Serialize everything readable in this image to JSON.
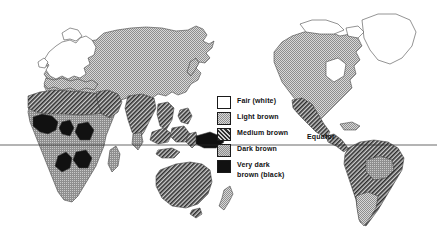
{
  "figure": {
    "kind": "thematic-world-map",
    "projection_note": "Pacific-centred split world map; Eurasia/Africa left, Americas right"
  },
  "equator": {
    "label": "Equator",
    "line_y_px": 145
  },
  "legend": {
    "title": "",
    "items": [
      {
        "key": "fair",
        "label": "Fair (white)",
        "fill": "#ffffff",
        "pattern": "none"
      },
      {
        "key": "light",
        "label": "Light brown",
        "fill": "#b9b9b9",
        "pattern": "fine-stipple"
      },
      {
        "key": "medium",
        "label": "Medium brown",
        "fill": "#8a8a8a",
        "pattern": "diagonal-hatch"
      },
      {
        "key": "dark",
        "label": "Dark brown",
        "fill": "#9c9c9c",
        "pattern": "coarse-stipple"
      },
      {
        "key": "verydark",
        "label": "Very dark\nbrown (black)",
        "fill": "#111111",
        "pattern": "solid"
      }
    ]
  },
  "legend_labels": {
    "fair": "Fair (white)",
    "light": "Light brown",
    "medium": "Medium brown",
    "dark": "Dark brown",
    "verydark_line1": "Very dark",
    "verydark_line2": "brown (black)"
  },
  "regions": [
    {
      "name": "Northern and north-western Europe",
      "class": "fair"
    },
    {
      "name": "Greenland and Canadian Arctic islands",
      "class": "fair"
    },
    {
      "name": "Scandinavia and British Isles",
      "class": "fair"
    },
    {
      "name": "Northern and central Asia (Siberia, China, Mongolia)",
      "class": "light"
    },
    {
      "name": "North America (USA and Canada)",
      "class": "light"
    },
    {
      "name": "Southern Europe and Mediterranean margin",
      "class": "light"
    },
    {
      "name": "Japan and Korea",
      "class": "light"
    },
    {
      "name": "Southern South America (Argentina, Chile)",
      "class": "light"
    },
    {
      "name": "New Zealand",
      "class": "light"
    },
    {
      "name": "North Africa and the Sahara",
      "class": "medium"
    },
    {
      "name": "Arabian peninsula and Middle East",
      "class": "medium"
    },
    {
      "name": "Indian subcontinent",
      "class": "medium"
    },
    {
      "name": "South-east Asian islands",
      "class": "medium"
    },
    {
      "name": "Australia (Aboriginal)",
      "class": "medium"
    },
    {
      "name": "Mexico and Central America",
      "class": "medium"
    },
    {
      "name": "Andean and northern South America",
      "class": "medium"
    },
    {
      "name": "Sub-Saharan Africa",
      "class": "dark"
    },
    {
      "name": "Amazon basin interior",
      "class": "dark"
    },
    {
      "name": "South India tip and Sri Lanka",
      "class": "dark"
    },
    {
      "name": "West Africa (Guinea coast)",
      "class": "verydark"
    },
    {
      "name": "Central and southern Africa interior",
      "class": "verydark"
    },
    {
      "name": "New Guinea and Melanesia",
      "class": "verydark"
    }
  ]
}
